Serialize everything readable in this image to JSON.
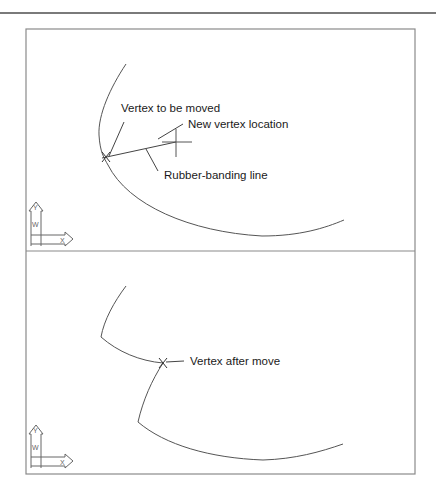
{
  "figure": {
    "panels": [
      {
        "id": "before",
        "labels": {
          "vertex_to_move": "Vertex to be moved",
          "new_location": "New vertex location",
          "rubber_band": "Rubber-banding line"
        },
        "ucs": {
          "y_axis": "Y",
          "x_axis": "X",
          "w_marker": "W"
        }
      },
      {
        "id": "after",
        "labels": {
          "vertex_after": "Vertex after move"
        },
        "ucs": {
          "y_axis": "Y",
          "x_axis": "X",
          "w_marker": "W"
        }
      }
    ],
    "colors": {
      "line": "#555555",
      "frame": "#8a8a8a",
      "text": "#1a1a1a",
      "rule": "#7a7a7a"
    }
  }
}
